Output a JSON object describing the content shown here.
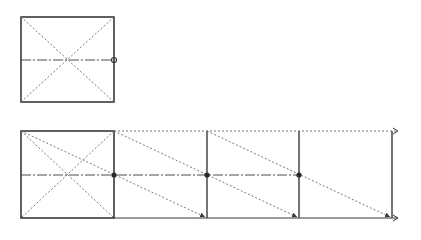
{
  "diagram": {
    "colors": {
      "stroke": "#3a3a3a",
      "dotted": "#6a6a6a",
      "background": "#ffffff"
    },
    "top_figure": {
      "square": {
        "x1": 21,
        "y1": 17,
        "x2": 114,
        "y2": 102
      },
      "diagonals": [
        [
          21,
          17,
          114,
          102
        ],
        [
          114,
          17,
          21,
          102
        ]
      ],
      "midline": [
        21,
        60,
        114,
        60
      ],
      "marker_circle": {
        "cx": 114,
        "cy": 60,
        "r": 2.5
      }
    },
    "bottom_figure": {
      "square": {
        "x1": 21,
        "y1": 131,
        "x2": 114,
        "y2": 218
      },
      "square_diagonals": [
        [
          21,
          131,
          114,
          218
        ],
        [
          114,
          131,
          21,
          218
        ]
      ],
      "verticals_x": [
        114,
        207,
        299,
        392
      ],
      "top_dotted_arrow": [
        114,
        131,
        398,
        131
      ],
      "bottom_solid_arrow": [
        114,
        218,
        398,
        218
      ],
      "midline": [
        21,
        175,
        299,
        175
      ],
      "midline_dots": [
        114,
        207,
        299
      ],
      "sliding_diagonals": [
        [
          21,
          131,
          207,
          218
        ],
        [
          114,
          131,
          299,
          218
        ],
        [
          207,
          131,
          392,
          218
        ]
      ]
    }
  }
}
